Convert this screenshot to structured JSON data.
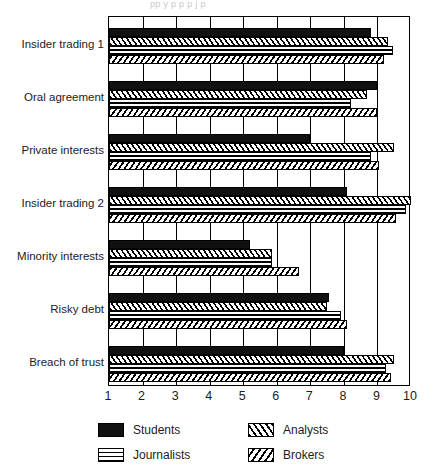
{
  "figure": {
    "title_sliver": "pp y p p p j p",
    "background": "#ffffff",
    "ink": "#000000"
  },
  "chart_data": {
    "type": "bar",
    "orientation": "horizontal",
    "title": "",
    "subtitle": "",
    "xlabel": "",
    "ylabel": "",
    "xlim": [
      1,
      10
    ],
    "ylim": [
      0,
      7
    ],
    "grid": true,
    "grid_axis": "x",
    "legend_position": "bottom-left",
    "xticks": [
      1,
      2,
      3,
      4,
      5,
      6,
      7,
      8,
      9,
      10
    ],
    "xticklabels": [
      "1",
      "2",
      "3",
      "4",
      "5",
      "6",
      "7",
      "8",
      "9",
      "10"
    ],
    "categories": [
      "Insider trading 1",
      "Oral agreement",
      "Private interests",
      "Insider trading 2",
      "Minority interests",
      "Risky debt",
      "Breach of trust"
    ],
    "series": [
      {
        "name": "Students",
        "pattern": "solid-black",
        "color": "#111111",
        "values": [
          8.8,
          9.0,
          7.0,
          8.1,
          5.2,
          7.55,
          8.0
        ]
      },
      {
        "name": "Analysts",
        "pattern": "diagonal-hatch-forward",
        "color": "#ffffff",
        "values": [
          9.3,
          8.7,
          9.5,
          10.0,
          5.85,
          7.5,
          9.5
        ]
      },
      {
        "name": "Journalists",
        "pattern": "crosshatch-grid",
        "color": "#ffffff",
        "values": [
          9.45,
          8.2,
          8.8,
          9.85,
          5.85,
          7.9,
          9.25
        ]
      },
      {
        "name": "Brokers",
        "pattern": "diagonal-hatch-backward",
        "color": "#ffffff",
        "values": [
          9.2,
          9.0,
          9.05,
          9.55,
          6.65,
          8.1,
          9.4
        ]
      }
    ]
  },
  "legend": {
    "entries": [
      {
        "label": "Students",
        "pattern": "students"
      },
      {
        "label": "Analysts",
        "pattern": "analysts"
      },
      {
        "label": "Journalists",
        "pattern": "journalists"
      },
      {
        "label": "Brokers",
        "pattern": "brokers"
      }
    ]
  }
}
